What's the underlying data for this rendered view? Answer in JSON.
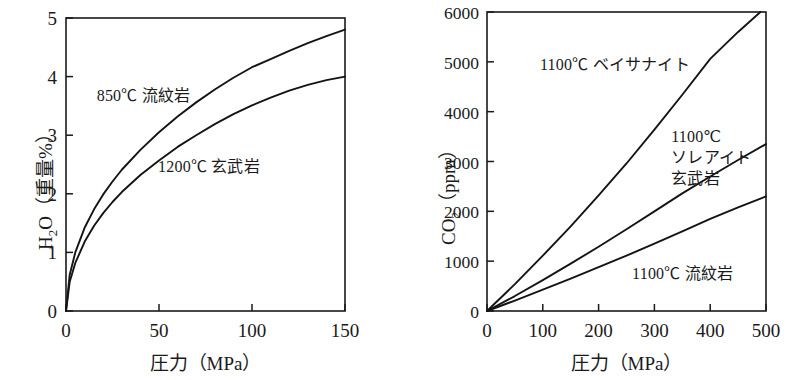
{
  "figure": {
    "background": "#ffffff",
    "line_color": "#141414",
    "panel_count": 2
  },
  "chart_data": [
    {
      "id": "h2o-solubility",
      "type": "line",
      "title": "",
      "xlabel": "圧力（MPa）",
      "ylabel": "H2O（重量%）",
      "ylabel_parts": {
        "prefix": "H",
        "sub": "2",
        "suffix": "O（重量%）"
      },
      "xlim": [
        0,
        150
      ],
      "ylim": [
        0,
        5
      ],
      "xticks": [
        0,
        50,
        100,
        150
      ],
      "xticklabels": [
        "0",
        "50",
        "100",
        "150"
      ],
      "yticks": [
        0,
        1,
        2,
        3,
        4,
        5
      ],
      "yticklabels": [
        "0",
        "1",
        "2",
        "3",
        "4",
        "5"
      ],
      "grid": false,
      "legend": "in-plot annotations",
      "series": [
        {
          "name": "850℃ 流紋岩",
          "x": [
            0,
            2,
            5,
            10,
            15,
            20,
            25,
            30,
            40,
            50,
            60,
            70,
            80,
            90,
            100,
            110,
            120,
            130,
            140,
            150
          ],
          "values": [
            0,
            0.62,
            1.0,
            1.42,
            1.73,
            1.99,
            2.21,
            2.41,
            2.75,
            3.05,
            3.32,
            3.56,
            3.78,
            3.98,
            4.16,
            4.3,
            4.44,
            4.57,
            4.69,
            4.8
          ]
        },
        {
          "name": "1200℃ 玄武岩",
          "x": [
            0,
            2,
            5,
            10,
            15,
            20,
            25,
            30,
            40,
            50,
            60,
            70,
            80,
            90,
            100,
            110,
            120,
            130,
            140,
            150
          ],
          "values": [
            0,
            0.5,
            0.82,
            1.18,
            1.45,
            1.67,
            1.86,
            2.03,
            2.32,
            2.57,
            2.8,
            3.0,
            3.19,
            3.36,
            3.51,
            3.64,
            3.76,
            3.86,
            3.94,
            4.0
          ]
        }
      ],
      "annotations": [
        {
          "text": "850℃ 流紋岩",
          "x_frac": 0.11,
          "y_frac": 0.23
        },
        {
          "text": "1200℃ 玄武岩",
          "x_frac": 0.33,
          "y_frac": 0.47
        }
      ]
    },
    {
      "id": "co2-solubility",
      "type": "line",
      "title": "",
      "xlabel": "圧力（MPa）",
      "ylabel": "CO2（ppm）",
      "ylabel_parts": {
        "prefix": "CO",
        "sub": "2",
        "suffix": "（ppm）"
      },
      "xlim": [
        0,
        500
      ],
      "ylim": [
        0,
        6000
      ],
      "xticks": [
        0,
        100,
        200,
        300,
        400,
        500
      ],
      "xticklabels": [
        "0",
        "100",
        "200",
        "300",
        "400",
        "500"
      ],
      "yticks": [
        0,
        1000,
        2000,
        3000,
        4000,
        5000,
        6000
      ],
      "yticklabels": [
        "0",
        "1000",
        "2000",
        "3000",
        "4000",
        "5000",
        "6000"
      ],
      "grid": false,
      "legend": "in-plot annotations",
      "series": [
        {
          "name": "1100℃ ベイサナイト",
          "x": [
            0,
            50,
            100,
            150,
            200,
            250,
            300,
            350,
            400,
            450,
            490
          ],
          "values": [
            0,
            540,
            1110,
            1700,
            2320,
            2960,
            3640,
            4340,
            5060,
            5600,
            6000
          ]
        },
        {
          "name": "1100℃ ソレアイト玄武岩",
          "x": [
            0,
            50,
            100,
            150,
            200,
            250,
            300,
            350,
            400,
            450,
            500
          ],
          "values": [
            0,
            300,
            620,
            950,
            1290,
            1640,
            2000,
            2360,
            2700,
            3030,
            3350
          ]
        },
        {
          "name": "1100℃ 流紋岩",
          "x": [
            0,
            50,
            100,
            150,
            200,
            250,
            300,
            350,
            400,
            450,
            500
          ],
          "values": [
            0,
            210,
            430,
            650,
            880,
            1110,
            1350,
            1600,
            1850,
            2080,
            2300
          ]
        }
      ],
      "annotations": [
        {
          "text": "1100℃ ベイサナイト",
          "x_frac": 0.19,
          "y_frac": 0.14
        },
        {
          "text_lines": [
            "1100℃",
            "ソレアイト",
            "玄武岩"
          ],
          "x_frac": 0.66,
          "y_frac": 0.38
        },
        {
          "text": "1100℃ 流紋岩",
          "x_frac": 0.52,
          "y_frac": 0.84
        }
      ]
    }
  ],
  "labels": {
    "left": {
      "ylabel_prefix": "H",
      "ylabel_sub": "2",
      "ylabel_suffix": "O（重量%）",
      "xlabel": "圧力（MPa）",
      "ytick_0": "0",
      "ytick_1": "1",
      "ytick_2": "2",
      "ytick_3": "3",
      "ytick_4": "4",
      "ytick_5": "5",
      "xtick_0": "0",
      "xtick_50": "50",
      "xtick_100": "100",
      "xtick_150": "150",
      "annot_rhyolite": "850℃ 流紋岩",
      "annot_basalt": "1200℃ 玄武岩"
    },
    "right": {
      "ylabel_prefix": "CO",
      "ylabel_sub": "2",
      "ylabel_suffix": "（ppm）",
      "xlabel": "圧力（MPa）",
      "ytick_0": "0",
      "ytick_1000": "1000",
      "ytick_2000": "2000",
      "ytick_3000": "3000",
      "ytick_4000": "4000",
      "ytick_5000": "5000",
      "ytick_6000": "6000",
      "xtick_0": "0",
      "xtick_100": "100",
      "xtick_200": "200",
      "xtick_300": "300",
      "xtick_400": "400",
      "xtick_500": "500",
      "annot_basanite": "1100℃ ベイサナイト",
      "annot_tholeiite_l1": "1100℃",
      "annot_tholeiite_l2": "ソレアイト",
      "annot_tholeiite_l3": "玄武岩",
      "annot_rhyolite": "1100℃ 流紋岩"
    }
  }
}
